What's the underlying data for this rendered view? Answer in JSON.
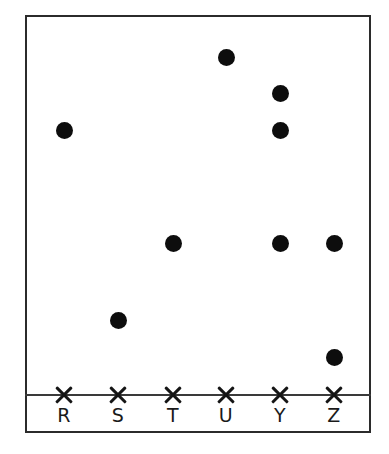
{
  "chart_data": {
    "type": "scatter",
    "title": "",
    "subtitle": "",
    "xlabel": "",
    "ylabel": "",
    "grid": false,
    "legend": null,
    "categories": [
      "R",
      "S",
      "T",
      "U",
      "Y",
      "Z"
    ],
    "counts_per_category": [
      1,
      1,
      1,
      1,
      3,
      2
    ],
    "axis": {
      "tick_marker": "x-cross",
      "tick_count": 6,
      "baseline_y_px": 395,
      "category_positions_px": [
        64,
        118,
        173,
        226,
        280,
        334
      ]
    },
    "points": [
      {
        "category": "R",
        "x_px": 64,
        "y_px": 130,
        "stack_index": 0
      },
      {
        "category": "S",
        "x_px": 118,
        "y_px": 320,
        "stack_index": 0
      },
      {
        "category": "T",
        "x_px": 173,
        "y_px": 243,
        "stack_index": 0
      },
      {
        "category": "U",
        "x_px": 226,
        "y_px": 57,
        "stack_index": 0
      },
      {
        "category": "Y",
        "x_px": 280,
        "y_px": 93,
        "stack_index": 0
      },
      {
        "category": "Y",
        "x_px": 280,
        "y_px": 130,
        "stack_index": 1
      },
      {
        "category": "Y",
        "x_px": 280,
        "y_px": 243,
        "stack_index": 2
      },
      {
        "category": "Z",
        "x_px": 334,
        "y_px": 243,
        "stack_index": 0
      },
      {
        "category": "Z",
        "x_px": 334,
        "y_px": 357,
        "stack_index": 1
      }
    ],
    "marker": {
      "shape": "filled-circle",
      "color": "#0d0d0d",
      "diameter_px": 17
    },
    "colors": {
      "background": "#ffffff",
      "frame": "#2b2b2b",
      "axis": "#3a3a3a",
      "marker": "#0d0d0d",
      "label": "#1a1a1a"
    },
    "frame": {
      "left_px": 25,
      "top_px": 15,
      "width_px": 346,
      "height_px": 418
    }
  }
}
